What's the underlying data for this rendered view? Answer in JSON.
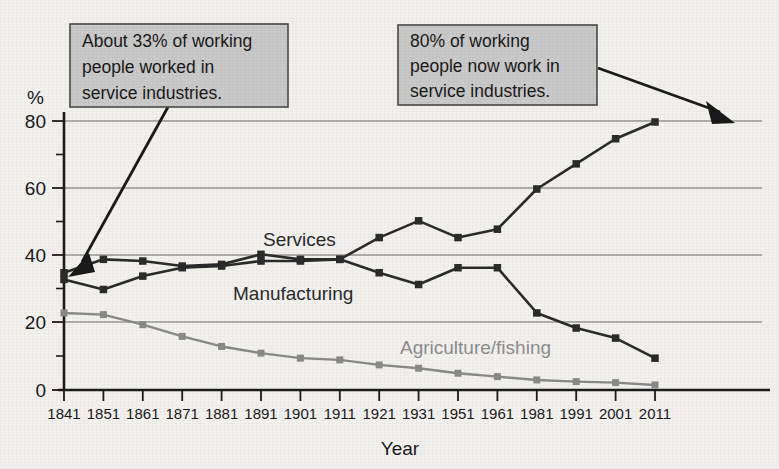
{
  "chart_data": {
    "type": "line",
    "title": "",
    "xlabel": "Year",
    "ylabel": "%",
    "ylim": [
      0,
      80
    ],
    "yticks": [
      0,
      20,
      40,
      60,
      80
    ],
    "grid": true,
    "legend": "inline-labels",
    "x": [
      1841,
      1851,
      1861,
      1871,
      1881,
      1891,
      1901,
      1911,
      1921,
      1931,
      1951,
      1961,
      1981,
      1991,
      2001,
      2011
    ],
    "xtick_labels": [
      "1841",
      "1851",
      "1861",
      "1871",
      "1881",
      "1891",
      "1901",
      "1911",
      "1921",
      "1931",
      "1951",
      "1961",
      "1981",
      "1991",
      "2001",
      "2011"
    ],
    "series": [
      {
        "name": "Services",
        "color": "#2b2b2b",
        "values": [
          35,
          39,
          38.5,
          37,
          37.5,
          40.5,
          39,
          39,
          45.5,
          50.5,
          45.5,
          48,
          60,
          67.5,
          75,
          80
        ]
      },
      {
        "name": "Manufacturing",
        "color": "#2b2b2b",
        "values": [
          33,
          30,
          34,
          36.5,
          37,
          38.5,
          38.5,
          39,
          35,
          31.5,
          36.5,
          36.5,
          23,
          18.5,
          15.5,
          9.5
        ]
      },
      {
        "name": "Agriculture/fishing",
        "color": "#8a8a8a",
        "values": [
          23,
          22.5,
          19.5,
          16,
          13,
          11,
          9.5,
          9,
          7.5,
          6.5,
          5,
          4,
          3,
          2.5,
          2.2,
          1.5
        ]
      }
    ]
  },
  "series_labels": [
    {
      "text": "Services",
      "style": "dark"
    },
    {
      "text": "Manufacturing",
      "style": "dark"
    },
    {
      "text": "Agriculture/fishing",
      "style": "gray"
    }
  ],
  "axes": {
    "y_unit_label": "%",
    "x_axis_title": "Year",
    "y_tick_labels": [
      "80",
      "60",
      "40",
      "20",
      "0"
    ]
  },
  "callouts": [
    {
      "id": "callout-left",
      "lines": [
        "About 33% of working",
        "people worked in",
        "service industries."
      ],
      "points_to_year": "1841",
      "points_to_value": 35
    },
    {
      "id": "callout-right",
      "lines": [
        "80% of working",
        "people now work in",
        "service industries."
      ],
      "points_to_year": "2011",
      "points_to_value": 80
    }
  ],
  "colors": {
    "background": "#f2f1ee",
    "axis": "#1c1c1c",
    "grid": "#6d6d6d",
    "dark_series": "#2b2b2b",
    "gray_series": "#8a8a8a",
    "callout_fill": "#c9c9c9",
    "callout_border": "#4a4a4a"
  }
}
